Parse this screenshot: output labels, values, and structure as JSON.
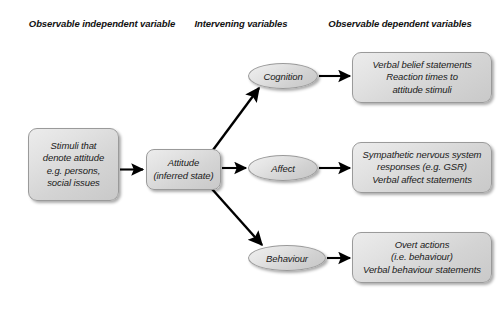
{
  "diagram": {
    "headings": [
      {
        "id": "independent",
        "text": "Observable independent\nvariable"
      },
      {
        "id": "intervening",
        "text": "Intervening\nvariables"
      },
      {
        "id": "dependent",
        "text": "Observable dependent\nvariables"
      }
    ],
    "nodes": {
      "stimuli": {
        "label": "Stimuli that\ndenote attitude\ne.g. persons,\nsocial issues",
        "shape": "rounded-rect"
      },
      "attitude": {
        "label": "Attitude\n(inferred state)",
        "shape": "rounded-rect"
      },
      "cognition": {
        "label": "Cognition",
        "shape": "ellipse"
      },
      "affect": {
        "label": "Affect",
        "shape": "ellipse"
      },
      "behaviour": {
        "label": "Behaviour",
        "shape": "ellipse"
      },
      "cognition_out": {
        "label": "Verbal belief statements\nReaction times to\nattitude stimuli",
        "shape": "rounded-rect"
      },
      "affect_out": {
        "label": "Sympathetic nervous system\nresponses (e.g. GSR)\nVerbal affect statements",
        "shape": "rounded-rect"
      },
      "behaviour_out": {
        "label": "Overt actions\n(i.e. behaviour)\nVerbal behaviour statements",
        "shape": "rounded-rect"
      }
    },
    "edges": [
      {
        "id": "stimuli-to-attitude",
        "from": "stimuli",
        "to": "attitude",
        "style": "straight-horizontal"
      },
      {
        "id": "attitude-to-cognition",
        "from": "attitude",
        "to": "cognition",
        "style": "diagonal-up"
      },
      {
        "id": "attitude-to-affect",
        "from": "attitude",
        "to": "affect",
        "style": "straight-horizontal"
      },
      {
        "id": "attitude-to-behaviour",
        "from": "attitude",
        "to": "behaviour",
        "style": "diagonal-down"
      },
      {
        "id": "cognition-to-output",
        "from": "cognition",
        "to": "cognition_out",
        "style": "straight-horizontal"
      },
      {
        "id": "affect-to-output",
        "from": "affect",
        "to": "affect_out",
        "style": "straight-horizontal"
      },
      {
        "id": "behaviour-to-output",
        "from": "behaviour",
        "to": "behaviour_out",
        "style": "straight-horizontal"
      }
    ],
    "colors": {
      "background": "#ffffff",
      "node_fill_light": "#ececec",
      "node_fill_dark": "#c9c9c9",
      "node_border": "#9a9a9a",
      "text": "#1a1a1a",
      "arrow": "#000000"
    }
  }
}
